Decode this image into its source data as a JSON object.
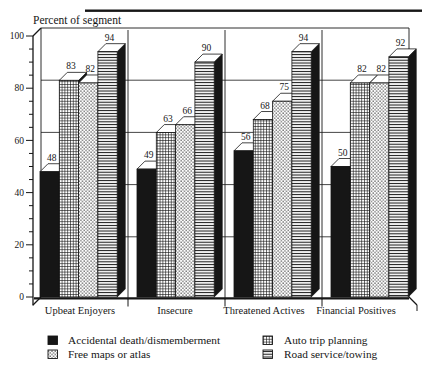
{
  "chart_data": {
    "type": "bar",
    "style": "3d-grouped-bars",
    "ylabel": "Percent of segment",
    "categories": [
      "Upbeat Enjoyers",
      "Insecure",
      "Threatened Actives",
      "Financial Positives"
    ],
    "series": [
      {
        "name": "Accidental death/dismemberment",
        "pattern": "solid",
        "values": [
          48,
          49,
          56,
          50
        ]
      },
      {
        "name": "Auto trip planning",
        "pattern": "grid",
        "values": [
          83,
          63,
          68,
          82
        ]
      },
      {
        "name": "Free maps or atlas",
        "pattern": "dots",
        "values": [
          82,
          66,
          75,
          82
        ]
      },
      {
        "name": "Road service/towing",
        "pattern": "hlines",
        "values": [
          94,
          90,
          94,
          92
        ]
      }
    ],
    "value_labels": [
      [
        "48",
        "83",
        "82",
        "94"
      ],
      [
        "49",
        "63",
        "66",
        "90"
      ],
      [
        "56",
        "68",
        "75",
        "94"
      ],
      [
        "50",
        "82",
        "82",
        "92"
      ]
    ],
    "y_axis": {
      "min": 0,
      "max": 100,
      "major_step": 20,
      "minor_step": 5,
      "tick_labels": [
        "0",
        "20",
        "40",
        "60",
        "80",
        "100"
      ]
    },
    "grid": true,
    "legend_position": "bottom",
    "legend_display_order": [
      "Accidental death/dismemberment",
      "Free maps or atlas",
      "Auto trip planning",
      "Road service/towing"
    ],
    "colors": {
      "ink": "#161616",
      "background": "#ffffff"
    }
  }
}
